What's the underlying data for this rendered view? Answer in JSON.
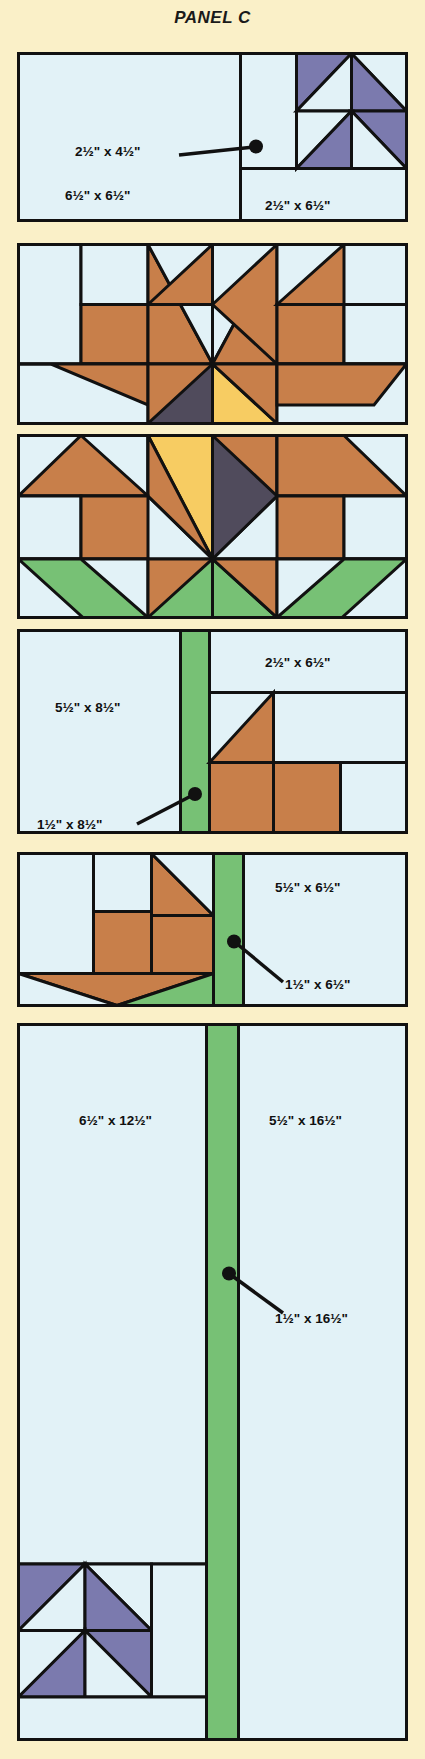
{
  "title": "PANEL C",
  "colors": {
    "background": "#faf0c8",
    "fabric_light": "#e2f2f7",
    "fabric_purple": "#7b7aae",
    "fabric_brown": "#c87f4a",
    "fabric_gold": "#f7cc62",
    "fabric_dark": "#504b5c",
    "fabric_green": "#77c175",
    "outline": "#111111"
  },
  "blocks": [
    {
      "id": "block-1",
      "name": "pinwheel-corner-block",
      "labels": [
        {
          "name": "label-2x4",
          "text": "2½\" x 4½\"",
          "leader": true
        },
        {
          "name": "label-6x6",
          "text": "6½\" x 6½\"",
          "leader": false
        },
        {
          "name": "label-2x6",
          "text": "2½\" x 6½\"",
          "leader": false
        }
      ]
    },
    {
      "id": "block-2",
      "name": "flower-top-block",
      "labels": []
    },
    {
      "id": "block-3",
      "name": "flower-bottom-leaves-block",
      "labels": []
    },
    {
      "id": "block-4",
      "name": "stem-bud-right-block",
      "labels": [
        {
          "name": "label-5x8",
          "text": "5½\" x 8½\"",
          "leader": false
        },
        {
          "name": "label-2x6",
          "text": "2½\" x 6½\"",
          "leader": false
        },
        {
          "name": "label-1x8",
          "text": "1½\" x 8½\"",
          "leader": true
        }
      ]
    },
    {
      "id": "block-5",
      "name": "stem-bud-left-block",
      "labels": [
        {
          "name": "label-5x6",
          "text": "5½\" x 6½\"",
          "leader": false
        },
        {
          "name": "label-1x6",
          "text": "1½\" x 6½\"",
          "leader": true
        }
      ]
    },
    {
      "id": "block-6",
      "name": "long-stem-pinwheel-block",
      "labels": [
        {
          "name": "label-6x12",
          "text": "6½\" x 12½\"",
          "leader": false
        },
        {
          "name": "label-5x16",
          "text": "5½\" x 16½\"",
          "leader": false
        },
        {
          "name": "label-1x16",
          "text": "1½\" x 16½\"",
          "leader": true
        }
      ]
    }
  ]
}
